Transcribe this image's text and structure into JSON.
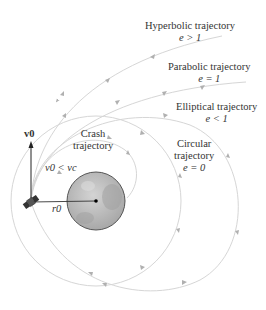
{
  "diagram": {
    "trajectories": [
      {
        "name": "Hyperbolic trajectory",
        "condition": "e > 1"
      },
      {
        "name": "Parabolic trajectory",
        "condition": "e = 1"
      },
      {
        "name": "Elliptical trajectory",
        "condition": "e < 1"
      },
      {
        "name": "Circular trajectory",
        "condition": "e = 0"
      },
      {
        "name": "Crash trajectory",
        "condition": "v0 < vc"
      }
    ],
    "labels": {
      "hyperbolic_title": "Hyperbolic trajectory",
      "hyperbolic_eq": "e > 1",
      "parabolic_title": "Parabolic trajectory",
      "parabolic_eq": "e = 1",
      "elliptical_title": "Elliptical trajectory",
      "elliptical_eq": "e < 1",
      "circular_line1": "Circular",
      "circular_line2": "trajectory",
      "circular_eq": "e = 0",
      "crash_line1": "Crash",
      "crash_line2": "trajectory",
      "crash_eq": "v0 < vc",
      "velocity": "v0",
      "radius": "r0"
    },
    "colors": {
      "curve": "#d6d6d6",
      "arrow": "#b0b0b0",
      "planet_fill": "#b9b9b9",
      "planet_edge": "#555555",
      "text": "#333333"
    }
  }
}
